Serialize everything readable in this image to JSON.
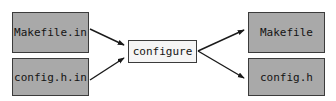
{
  "diagram": {
    "background_color": "#ffffff",
    "node_fill_gray": "#a9a9a9",
    "node_fill_light": "#f5f5f5",
    "node_border_color": "#3b3b3b",
    "arrow_color": "#1a1a1a",
    "nodes": {
      "makefile_in": {
        "label": "Makefile.in",
        "role": "input"
      },
      "config_h_in": {
        "label": "config.h.in",
        "role": "input"
      },
      "configure": {
        "label": "configure",
        "role": "process"
      },
      "makefile": {
        "label": "Makefile",
        "role": "output"
      },
      "config_h": {
        "label": "config.h",
        "role": "output"
      }
    },
    "edges": [
      {
        "from": "makefile_in",
        "to": "configure",
        "label": ""
      },
      {
        "from": "config_h_in",
        "to": "configure",
        "label": ""
      },
      {
        "from": "configure",
        "to": "makefile",
        "label": ""
      },
      {
        "from": "configure",
        "to": "config_h",
        "label": ""
      }
    ]
  }
}
